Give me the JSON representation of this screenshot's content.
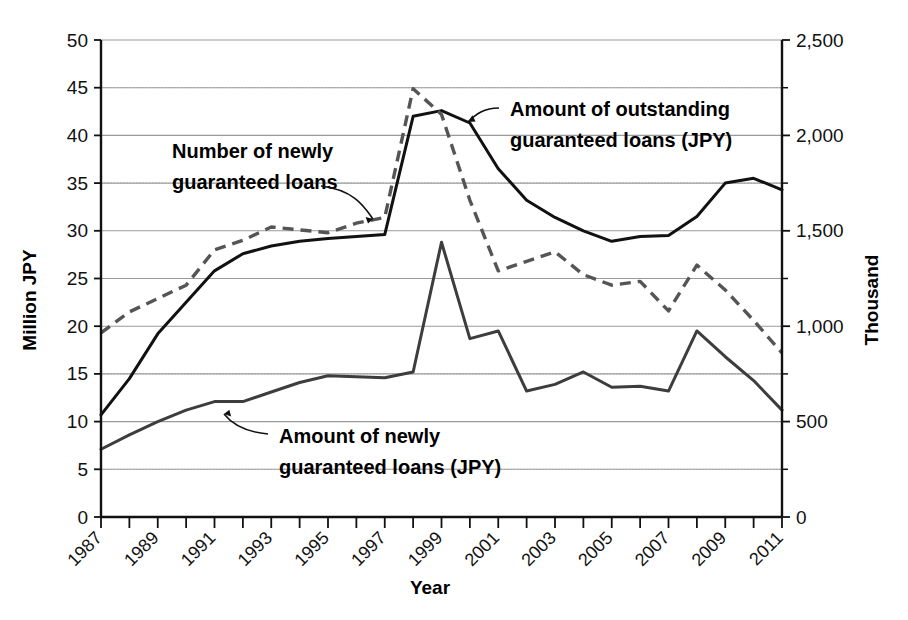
{
  "chart_data": {
    "type": "line",
    "title": "",
    "xlabel": "Year",
    "ylabel": "Million JPY",
    "y2label": "Thousand",
    "grid": true,
    "legend_position": "inline-annotations",
    "x": [
      1987,
      1988,
      1989,
      1990,
      1991,
      1992,
      1993,
      1994,
      1995,
      1996,
      1997,
      1998,
      1999,
      2000,
      2001,
      2002,
      2003,
      2004,
      2005,
      2006,
      2007,
      2008,
      2009,
      2010,
      2011
    ],
    "x_tick_labels": [
      "1987",
      "1988",
      "1989",
      "1990",
      "1991",
      "1992",
      "1993",
      "1994",
      "1995",
      "1996",
      "1997",
      "1998",
      "1999",
      "2000",
      "2001",
      "2002",
      "2003",
      "2004",
      "2005",
      "2006",
      "2007",
      "2008",
      "2009",
      "2010",
      "2011"
    ],
    "x_tick_labels_shown": [
      "1987",
      "1989",
      "1991",
      "1993",
      "1995",
      "1997",
      "1999",
      "2001",
      "2003",
      "2005",
      "2007",
      "2009",
      "2011"
    ],
    "ylim": [
      0,
      50
    ],
    "y_ticks": [
      0,
      5,
      10,
      15,
      20,
      25,
      30,
      35,
      40,
      45,
      50
    ],
    "y_tick_labels": [
      "0",
      "5",
      "10",
      "15",
      "20",
      "25",
      "30",
      "35",
      "40",
      "45",
      "50"
    ],
    "y2lim": [
      0,
      2500
    ],
    "y2_ticks": [
      0,
      500,
      1000,
      1500,
      2000,
      2500
    ],
    "y2_tick_labels": [
      "0",
      "500",
      "1,000",
      "1,500",
      "2,000",
      "2,500"
    ],
    "y2_minor_ticks": [
      250,
      750,
      1250,
      1750,
      2250
    ],
    "series": [
      {
        "name": "Amount of outstanding guaranteed loans (JPY)",
        "style": "solid-thick",
        "axis": "left",
        "unit": "Million JPY",
        "values": [
          10.7,
          14.5,
          19.2,
          22.5,
          25.8,
          27.6,
          28.4,
          28.9,
          29.2,
          29.4,
          29.6,
          42.0,
          42.6,
          41.3,
          36.5,
          33.2,
          31.4,
          30.0,
          28.9,
          29.4,
          29.5,
          31.5,
          35.0,
          35.5,
          34.3
        ]
      },
      {
        "name": "Number of newly guaranteed loans",
        "style": "dashed",
        "axis": "right",
        "unit": "Thousand",
        "values": [
          965,
          1075,
          1145,
          1215,
          1400,
          1450,
          1520,
          1505,
          1490,
          1540,
          1570,
          2245,
          2110,
          1660,
          1290,
          1340,
          1390,
          1270,
          1215,
          1235,
          1080,
          1320,
          1190,
          1030,
          860
        ]
      },
      {
        "name": "Amount of newly guaranteed loans (JPY)",
        "style": "solid-thin",
        "axis": "left",
        "unit": "Million JPY",
        "values": [
          7.1,
          8.6,
          10.0,
          11.2,
          12.1,
          12.1,
          13.1,
          14.1,
          14.8,
          14.7,
          14.6,
          15.2,
          28.8,
          18.7,
          19.5,
          13.2,
          13.9,
          15.2,
          13.6,
          13.7,
          13.2,
          19.5,
          16.8,
          14.3,
          11.2
        ]
      }
    ],
    "annotations": [
      {
        "id": "annotation-number-newly-guaranteed",
        "lines": [
          "Number of newly",
          "guaranteed loans"
        ],
        "target_series": "Number of newly guaranteed loans"
      },
      {
        "id": "annotation-outstanding-guaranteed",
        "lines": [
          "Amount of outstanding",
          "guaranteed loans (JPY)"
        ],
        "target_series": "Amount of outstanding guaranteed loans (JPY)"
      },
      {
        "id": "annotation-newly-guaranteed-amount",
        "lines": [
          "Amount of newly",
          "guaranteed loans (JPY)"
        ],
        "target_series": "Amount of newly guaranteed loans (JPY)"
      }
    ],
    "colors": {
      "axis": "#111111",
      "grid_major": "#9a9a9a",
      "grid_minor": "#bdbdbd",
      "outstanding_line": "#111111",
      "newly_number_line": "#555555",
      "newly_amount_line": "#3d3d3d",
      "background": "#ffffff"
    }
  }
}
